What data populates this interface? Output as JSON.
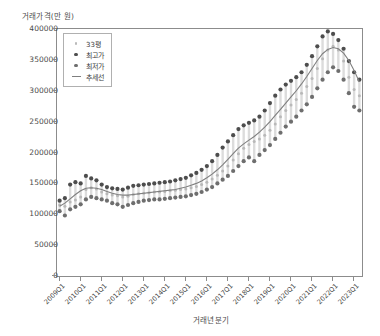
{
  "chart_data": {
    "type": "scatter",
    "title": "",
    "xlabel": "거래년분기",
    "ylabel": "거래가격(만 원)",
    "ylim": [
      0,
      400000
    ],
    "yticks": [
      0,
      50000,
      100000,
      150000,
      200000,
      250000,
      300000,
      350000,
      400000
    ],
    "ytick_labels": [
      "0",
      "50000",
      "100000",
      "150000",
      "200000",
      "250000",
      "300000",
      "350000",
      "400000"
    ],
    "grid": false,
    "legend_position": "upper left",
    "xtick_labels": [
      "2009Q1",
      "2010Q1",
      "2011Q1",
      "2012Q1",
      "2013Q1",
      "2014Q1",
      "2015Q1",
      "2016Q1",
      "2017Q1",
      "2018Q1",
      "2019Q1",
      "2020Q1",
      "2021Q1",
      "2022Q1",
      "2023Q1"
    ],
    "xtick_positions": [
      0,
      4,
      8,
      12,
      16,
      20,
      24,
      28,
      32,
      36,
      40,
      44,
      48,
      52,
      56
    ],
    "x_index_range": [
      0,
      57
    ],
    "colors": {
      "mean": "#b9b9b9",
      "high": "#4d4d4d",
      "low": "#6e6e6e",
      "trend": "#7f7f7f",
      "axis": "#8c8c8c",
      "text": "#4a4a4a"
    },
    "series": [
      {
        "name": "33평",
        "marker": "circle-small",
        "color": "#b9b9b9",
        "values": [
          115000,
          113000,
          120000,
          123000,
          128000,
          140000,
          143000,
          141000,
          136000,
          133000,
          131000,
          130000,
          128000,
          129000,
          132000,
          133000,
          134000,
          135000,
          136000,
          136000,
          137000,
          138000,
          139000,
          140000,
          141000,
          143000,
          145000,
          148000,
          152000,
          157000,
          163000,
          170000,
          178000,
          188000,
          198000,
          207000,
          213000,
          218000,
          222000,
          228000,
          236000,
          246000,
          258000,
          268000,
          277000,
          286000,
          296000,
          307000,
          320000,
          336000,
          352000,
          366000,
          372000,
          366000,
          348000,
          322000,
          302000,
          292000
        ]
      },
      {
        "name": "최고가",
        "marker": "circle",
        "color": "#4d4d4d",
        "values": [
          122000,
          126000,
          148000,
          152000,
          150000,
          162000,
          158000,
          155000,
          148000,
          144000,
          142000,
          141000,
          140000,
          143000,
          146000,
          147000,
          148000,
          149000,
          150000,
          151000,
          152000,
          153000,
          155000,
          157000,
          159000,
          163000,
          167000,
          172000,
          178000,
          186000,
          196000,
          208000,
          218000,
          228000,
          238000,
          244000,
          248000,
          252000,
          258000,
          268000,
          280000,
          292000,
          302000,
          310000,
          316000,
          322000,
          330000,
          342000,
          356000,
          372000,
          388000,
          396000,
          392000,
          382000,
          368000,
          348000,
          330000,
          318000
        ]
      },
      {
        "name": "최저가",
        "marker": "circle",
        "color": "#6e6e6e",
        "values": [
          105000,
          98000,
          108000,
          112000,
          116000,
          124000,
          128000,
          126000,
          124000,
          122000,
          118000,
          116000,
          112000,
          115000,
          118000,
          120000,
          122000,
          123000,
          124000,
          124000,
          125000,
          126000,
          127000,
          128000,
          129000,
          131000,
          133000,
          136000,
          140000,
          144000,
          150000,
          156000,
          162000,
          170000,
          178000,
          186000,
          192000,
          186000,
          196000,
          204000,
          212000,
          222000,
          232000,
          242000,
          250000,
          258000,
          268000,
          278000,
          290000,
          304000,
          318000,
          330000,
          338000,
          332000,
          318000,
          296000,
          274000,
          268000
        ]
      },
      {
        "name": "추세선",
        "marker": "line",
        "color": "#7f7f7f",
        "values": [
          113000,
          118000,
          125000,
          132000,
          138000,
          142000,
          143000,
          142000,
          140000,
          137000,
          134000,
          132000,
          131000,
          131000,
          132000,
          133000,
          134000,
          135000,
          136000,
          137000,
          138000,
          139000,
          140000,
          142000,
          144000,
          147000,
          150000,
          154000,
          159000,
          165000,
          172000,
          180000,
          189000,
          198000,
          207000,
          214000,
          220000,
          226000,
          233000,
          241000,
          250000,
          260000,
          270000,
          280000,
          290000,
          300000,
          311000,
          323000,
          336000,
          349000,
          360000,
          367000,
          370000,
          368000,
          361000,
          349000,
          333000,
          314000
        ]
      }
    ],
    "legend": [
      {
        "label": "33평",
        "marker": "dot-light",
        "color": "#b9b9b9"
      },
      {
        "label": "최고가",
        "marker": "dot-dark",
        "color": "#4d4d4d"
      },
      {
        "label": "최저가",
        "marker": "dot-mid",
        "color": "#6e6e6e"
      },
      {
        "label": "추세선",
        "marker": "line",
        "color": "#7f7f7f"
      }
    ]
  }
}
